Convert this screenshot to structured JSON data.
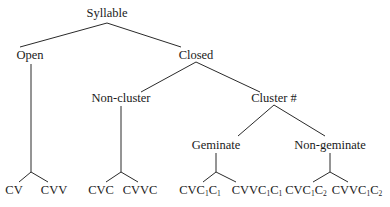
{
  "diagram": {
    "type": "tree",
    "root": "Syllable",
    "nodes": {
      "syllable": "Syllable",
      "open": "Open",
      "closed": "Closed",
      "non_cluster": "Non-cluster",
      "cluster": "Cluster #",
      "geminate": "Geminate",
      "non_geminate": "Non-geminate"
    },
    "leaves": [
      {
        "id": "cv",
        "base": "CV",
        "parts": [
          "CV"
        ]
      },
      {
        "id": "cvv",
        "base": "CVV",
        "parts": [
          "CVV"
        ]
      },
      {
        "id": "cvc",
        "base": "CVC",
        "parts": [
          "CVC"
        ]
      },
      {
        "id": "cvvc",
        "base": "CVVC",
        "parts": [
          "CVVC"
        ]
      },
      {
        "id": "cvc1c1",
        "text": "CVC1C1"
      },
      {
        "id": "cvvc1c1",
        "text": "CVVC1C1"
      },
      {
        "id": "cvc1c2",
        "text": "CVC1C2"
      },
      {
        "id": "cvvc1c2",
        "text": "CVVC1C2"
      }
    ],
    "leaf_parts": {
      "cv": "CV",
      "cvv": "CVV",
      "cvc": "CVC",
      "cvvc": "CVVC",
      "cvc1c1": {
        "a": "CVC",
        "s1": "1",
        "b": "C",
        "s2": "1"
      },
      "cvvc1c1": {
        "a": "CVVC",
        "s1": "1",
        "b": "C",
        "s2": "1"
      },
      "cvc1c2": {
        "a": "CVC",
        "s1": "1",
        "b": "C",
        "s2": "2"
      },
      "cvvc1c2": {
        "a": "CVVC",
        "s1": "1",
        "b": "C",
        "s2": "2"
      }
    },
    "edges": [
      [
        "Syllable",
        "Open"
      ],
      [
        "Syllable",
        "Closed"
      ],
      [
        "Open",
        "CV"
      ],
      [
        "Open",
        "CVV"
      ],
      [
        "Closed",
        "Non-cluster"
      ],
      [
        "Closed",
        "Cluster #"
      ],
      [
        "Non-cluster",
        "CVC"
      ],
      [
        "Non-cluster",
        "CVVC"
      ],
      [
        "Cluster #",
        "Geminate"
      ],
      [
        "Cluster #",
        "Non-geminate"
      ],
      [
        "Geminate",
        "CVC1C1"
      ],
      [
        "Geminate",
        "CVVC1C1"
      ],
      [
        "Non-geminate",
        "CVC1C2"
      ],
      [
        "Non-geminate",
        "CVVC1C2"
      ]
    ]
  }
}
